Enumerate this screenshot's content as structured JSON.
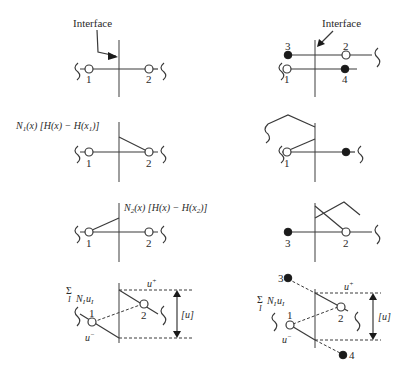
{
  "figure": {
    "left_column": {
      "panel_1": {
        "interface_label": "Interface",
        "nodes": [
          {
            "id": "1",
            "type": "open"
          },
          {
            "id": "2",
            "type": "open"
          }
        ]
      },
      "panel_2": {
        "label_func": "N",
        "label_sub": "1",
        "label_rest": "(x) [H(x) − H(x",
        "label_sub2": "1",
        "label_end": ")]",
        "nodes": [
          {
            "id": "1",
            "type": "open"
          },
          {
            "id": "2",
            "type": "open"
          }
        ]
      },
      "panel_3": {
        "label_func": "N",
        "label_sub": "2",
        "label_rest": "(x) [H(x) − H(x",
        "label_sub2": "2",
        "label_end": ")]",
        "nodes": [
          {
            "id": "1",
            "type": "open"
          },
          {
            "id": "2",
            "type": "open"
          }
        ]
      },
      "panel_4": {
        "sum_symbol": "Σ",
        "sum_index": "I",
        "sum_expr_N": "N",
        "sum_expr_u": "u",
        "sub_I": "I",
        "u_plus": "u",
        "u_minus": "u",
        "plus": "+",
        "minus": "−",
        "jump": "[u]",
        "nodes": [
          {
            "id": "1",
            "type": "open"
          },
          {
            "id": "2",
            "type": "open"
          }
        ]
      }
    },
    "right_column": {
      "panel_1": {
        "interface_label": "Interface",
        "nodes": [
          {
            "id": "3",
            "type": "solid"
          },
          {
            "id": "2",
            "type": "open"
          },
          {
            "id": "1",
            "type": "open"
          },
          {
            "id": "4",
            "type": "solid"
          }
        ]
      },
      "panel_2": {
        "nodes": [
          {
            "id": "1",
            "type": "open"
          },
          {
            "id": "4",
            "type": "solid"
          }
        ]
      },
      "panel_3": {
        "nodes": [
          {
            "id": "3",
            "type": "solid"
          },
          {
            "id": "2",
            "type": "open"
          }
        ]
      },
      "panel_4": {
        "sum_symbol": "Σ",
        "sum_index": "I",
        "sum_expr_N": "N",
        "sum_expr_u": "u",
        "sub_I": "I",
        "u_plus": "u",
        "u_minus": "u",
        "plus": "+",
        "minus": "−",
        "jump": "[u]",
        "nodes": [
          {
            "id": "3",
            "type": "solid"
          },
          {
            "id": "1",
            "type": "open"
          },
          {
            "id": "2",
            "type": "open"
          },
          {
            "id": "4",
            "type": "solid"
          }
        ]
      }
    }
  }
}
